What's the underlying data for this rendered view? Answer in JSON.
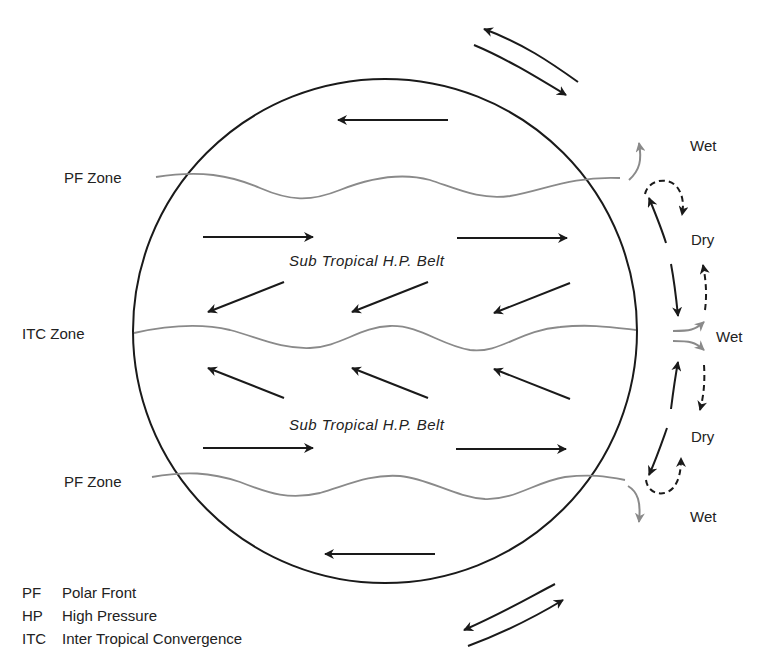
{
  "diagram": {
    "type": "global atmospheric circulation",
    "zones": [
      {
        "label": "PF Zone",
        "position": "northern"
      },
      {
        "label": "ITC Zone",
        "position": "equator"
      },
      {
        "label": "PF Zone",
        "position": "southern"
      }
    ],
    "belts": [
      {
        "label": "Sub Tropical H.P. Belt",
        "position": "northern"
      },
      {
        "label": "Sub Tropical H.P. Belt",
        "position": "southern"
      }
    ],
    "climate_labels": [
      "Wet",
      "Dry",
      "Wet",
      "Dry",
      "Wet"
    ],
    "wind_directions": {
      "polar_north": "easterly",
      "westerlies_north": "westerly",
      "trades_north": "north-east",
      "trades_south": "south-east",
      "westerlies_south": "westerly",
      "polar_south": "easterly"
    },
    "colors": {
      "outline": "#1a1a1a",
      "zone_line": "#8a8a8a",
      "text": "#222222"
    }
  },
  "legend": [
    {
      "abbr": "PF",
      "meaning": "Polar Front"
    },
    {
      "abbr": "HP",
      "meaning": "High Pressure"
    },
    {
      "abbr": "ITC",
      "meaning": "Inter Tropical Convergence"
    }
  ]
}
